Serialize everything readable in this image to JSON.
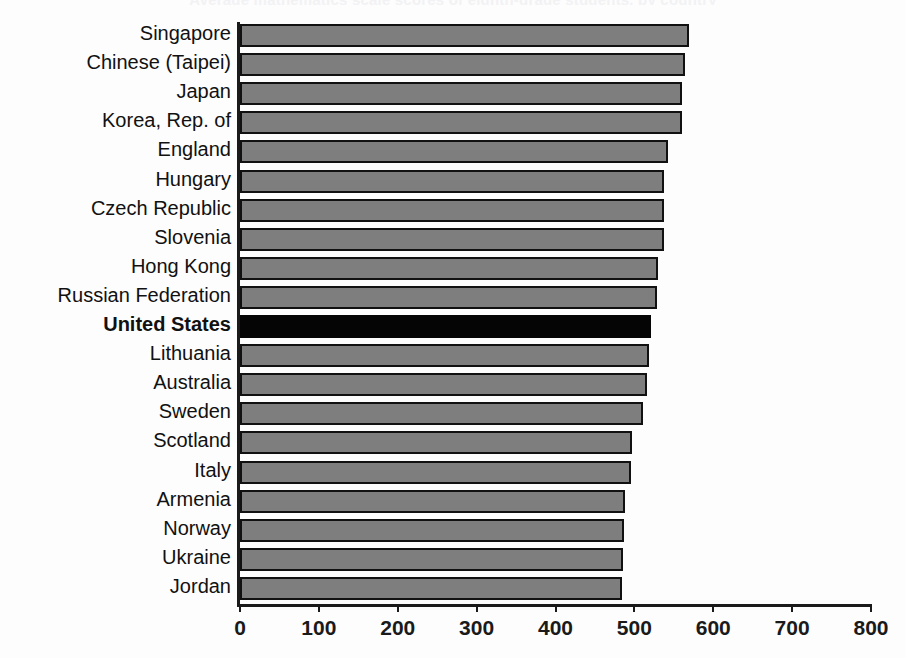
{
  "chart_data": {
    "type": "bar",
    "orientation": "horizontal",
    "title": "Average mathematics scale scores of eighth-grade students, by country",
    "xlabel": "",
    "ylabel": "",
    "xlim": [
      0,
      800
    ],
    "xticks": [
      0,
      100,
      200,
      300,
      400,
      500,
      600,
      700,
      800
    ],
    "xtick_labels": [
      "0",
      "100",
      "200",
      "300",
      "400",
      "500",
      "600",
      "700",
      "800"
    ],
    "grid": false,
    "legend": "none",
    "highlight_category": "United States",
    "colors": {
      "bar_fill": "#7e7e7e",
      "bar_edge": "#111111",
      "highlight_fill": "#050505",
      "axis": "#1a1a1a",
      "background": "#fdfdfd",
      "text": "#111111"
    },
    "categories": [
      "Singapore",
      "Chinese (Taipei)",
      "Japan",
      "Korea, Rep. of",
      "England",
      "Hungary",
      "Czech Republic",
      "Slovenia",
      "Hong Kong",
      "Russian Federation",
      "United States",
      "Lithuania",
      "Australia",
      "Sweden",
      "Scotland",
      "Italy",
      "Armenia",
      "Norway",
      "Ukraine",
      "Jordan"
    ],
    "values": [
      569,
      564,
      560,
      560,
      542,
      538,
      538,
      537,
      530,
      529,
      521,
      519,
      516,
      511,
      497,
      496,
      488,
      487,
      485,
      484
    ]
  }
}
